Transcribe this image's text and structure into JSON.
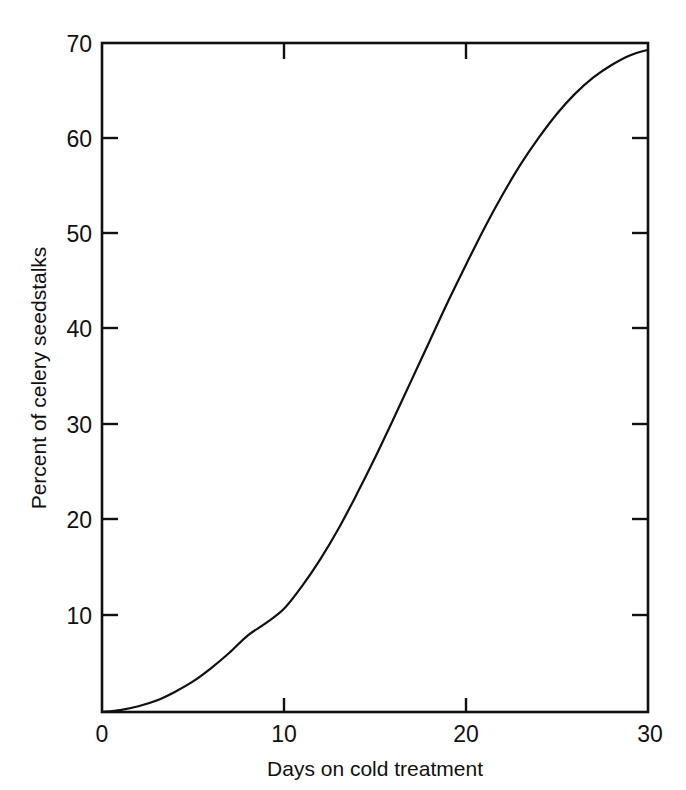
{
  "chart_data": {
    "type": "line",
    "title": "",
    "subtitle": "",
    "xlabel": "Days on cold treatment",
    "ylabel": "Percent of celery seedstalks",
    "xlim": [
      0,
      30
    ],
    "ylim": [
      0,
      70
    ],
    "xticks": [
      0,
      10,
      20,
      30
    ],
    "yticks": [
      10,
      20,
      30,
      40,
      50,
      60,
      70
    ],
    "xtick_labels": [
      "0",
      "10",
      "20",
      "30"
    ],
    "ytick_labels": [
      "10",
      "20",
      "30",
      "40",
      "50",
      "60",
      "70"
    ],
    "grid": false,
    "legend": null,
    "legend_position": "none",
    "frame": "box",
    "tick_direction": "in-and-out",
    "line_color": "#101010",
    "line_width_px": 2,
    "annotations": [],
    "series": [
      {
        "name": "Percent of celery seedstalks",
        "x": [
          0,
          1,
          2,
          3,
          4,
          5,
          6,
          7,
          8,
          9,
          10,
          11,
          12,
          13,
          14,
          15,
          16,
          17,
          18,
          19,
          20,
          21,
          22,
          23,
          24,
          25,
          26,
          27,
          28,
          29,
          30
        ],
        "values": [
          0.0,
          0.2,
          0.6,
          1.2,
          2.1,
          3.2,
          4.6,
          6.2,
          8.0,
          9.3,
          10.8,
          13.2,
          16.0,
          19.2,
          22.8,
          26.6,
          30.6,
          34.7,
          38.8,
          42.9,
          46.8,
          50.6,
          54.1,
          57.3,
          60.1,
          62.6,
          64.7,
          66.4,
          67.7,
          68.7,
          69.3
        ]
      }
    ]
  },
  "axes": {
    "y_title": "Percent of celery seedstalks",
    "x_title": "Days on cold treatment"
  },
  "ticks": {
    "y": [
      {
        "label": "70",
        "value": 70
      },
      {
        "label": "60",
        "value": 60
      },
      {
        "label": "50",
        "value": 50
      },
      {
        "label": "40",
        "value": 40
      },
      {
        "label": "30",
        "value": 30
      },
      {
        "label": "20",
        "value": 20
      },
      {
        "label": "10",
        "value": 10
      }
    ],
    "x": [
      {
        "label": "0",
        "value": 0
      },
      {
        "label": "10",
        "value": 10
      },
      {
        "label": "20",
        "value": 20
      },
      {
        "label": "30",
        "value": 30
      }
    ]
  },
  "colors": {
    "background": "#ffffff",
    "ink": "#101010",
    "curve": "#101010"
  }
}
